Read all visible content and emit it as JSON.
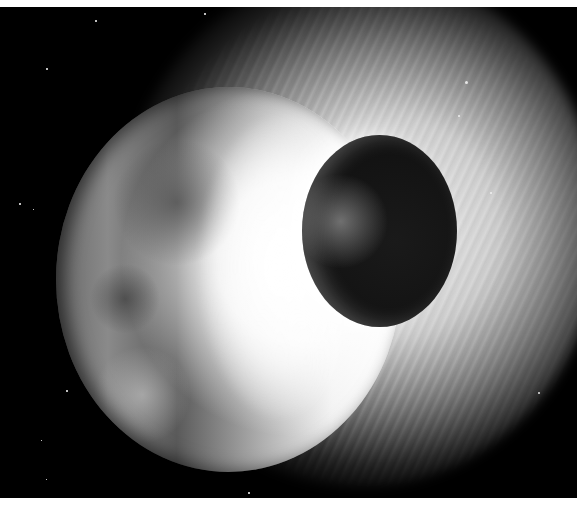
{
  "image": {
    "description": "Grayscale artist rendering of a planetary collision: a large moon-like planet on the left is struck by a smaller dark body, releasing a bright radial ejecta cloud against a starfield",
    "elements": {
      "background": "starfield",
      "large_body": "cratered planet (left)",
      "small_body": "dark impactor (right-center)",
      "ejecta": "bright radial debris cloud"
    },
    "palette": {
      "space": "#000000",
      "ejecta": "#ffffff",
      "planet_dark": "#5a5a5a",
      "planet_light": "#b0b0b0",
      "impactor": "#141414",
      "frame": "#ffffff"
    }
  }
}
